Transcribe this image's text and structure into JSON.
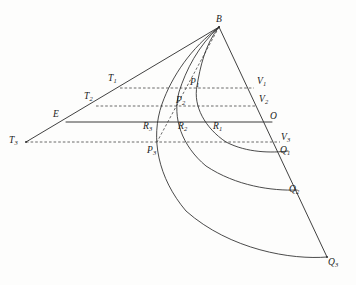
{
  "figure": {
    "kind": "geometric-construction-diagram",
    "background_color": "#fdfdfc",
    "ink_color": "#2b2b2b",
    "width": 356,
    "height": 285
  },
  "labels": {
    "B": {
      "base": "B",
      "sub": "",
      "x": 216,
      "y": 15
    },
    "T1": {
      "base": "T",
      "sub": "1",
      "x": 108,
      "y": 74
    },
    "T2": {
      "base": "T",
      "sub": "2",
      "x": 84,
      "y": 92
    },
    "T3": {
      "base": "T",
      "sub": "3",
      "x": 9,
      "y": 136
    },
    "E": {
      "base": "E",
      "sub": "",
      "x": 53,
      "y": 110
    },
    "O": {
      "base": "O",
      "sub": "",
      "x": 270,
      "y": 112
    },
    "V1": {
      "base": "V",
      "sub": "1",
      "x": 257,
      "y": 77
    },
    "V2": {
      "base": "V",
      "sub": "2",
      "x": 259,
      "y": 95
    },
    "V3": {
      "base": "V",
      "sub": "3",
      "x": 281,
      "y": 133
    },
    "P1": {
      "base": "P",
      "sub": "1",
      "x": 190,
      "y": 78
    },
    "P2": {
      "base": "P",
      "sub": "2",
      "x": 176,
      "y": 96
    },
    "P3": {
      "base": "P",
      "sub": "3",
      "x": 147,
      "y": 146
    },
    "R1": {
      "base": "R",
      "sub": "1",
      "x": 213,
      "y": 122
    },
    "R2": {
      "base": "R",
      "sub": "2",
      "x": 178,
      "y": 122
    },
    "R3": {
      "base": "R",
      "sub": "3",
      "x": 143,
      "y": 122
    },
    "Q1": {
      "base": "Q",
      "sub": "1",
      "x": 280,
      "y": 146
    },
    "Q2": {
      "base": "Q",
      "sub": "2",
      "x": 289,
      "y": 185
    },
    "Q3": {
      "base": "Q",
      "sub": "3",
      "x": 328,
      "y": 258
    }
  },
  "geometry": {
    "points": {
      "B": [
        219,
        27
      ],
      "T1": [
        120,
        88
      ],
      "T2": [
        96,
        106
      ],
      "T3": [
        26,
        142
      ],
      "E": [
        66,
        122
      ],
      "O": [
        272,
        122
      ],
      "V1": [
        254,
        88
      ],
      "V2": [
        256,
        106
      ],
      "V3": [
        280,
        142
      ],
      "P1": [
        187,
        88
      ],
      "P2": [
        172,
        106
      ],
      "P3": [
        157,
        142
      ],
      "R1": [
        222,
        122
      ],
      "R2": [
        189,
        122
      ],
      "R3": [
        154,
        122
      ],
      "Q1": [
        288,
        151
      ],
      "Q2": [
        297,
        190
      ],
      "Q3": [
        327,
        257
      ]
    },
    "lines": {
      "ray_T3_through_E_to_B": "M26,142 L219,27",
      "edge_B_to_O_to_Q3": "M219,27 L327,257",
      "baseline_E_to_O": "M66,122 L272,122",
      "dashed_B_to_P3": "M219,27 L157,142"
    },
    "dashed_chords": {
      "T1_V1": "M120,88 L254,88",
      "T2_V2": "M96,106 L256,106",
      "T3_V3": "M26,142 L280,142"
    },
    "curves": {
      "curve_B_P1_R1_Q1": "M219,27 C205,44 200,68 197,86 C193,106 205,128 226,142 C247,153 272,153 288,151",
      "curve_B_P2_R2_Q2": "M219,27 C198,46 186,70 179,92 C172,118 182,146 206,166 C236,186 272,191 297,190",
      "curve_B_P3_R3_Q3": "M219,27 C191,48 172,76 162,104 C150,138 158,178 186,211 C230,250 292,260 327,257"
    }
  },
  "styles": {
    "dash_pattern": "2.6 2.0",
    "stroke_width_solid": 0.9,
    "stroke_width_curve": 0.85
  }
}
